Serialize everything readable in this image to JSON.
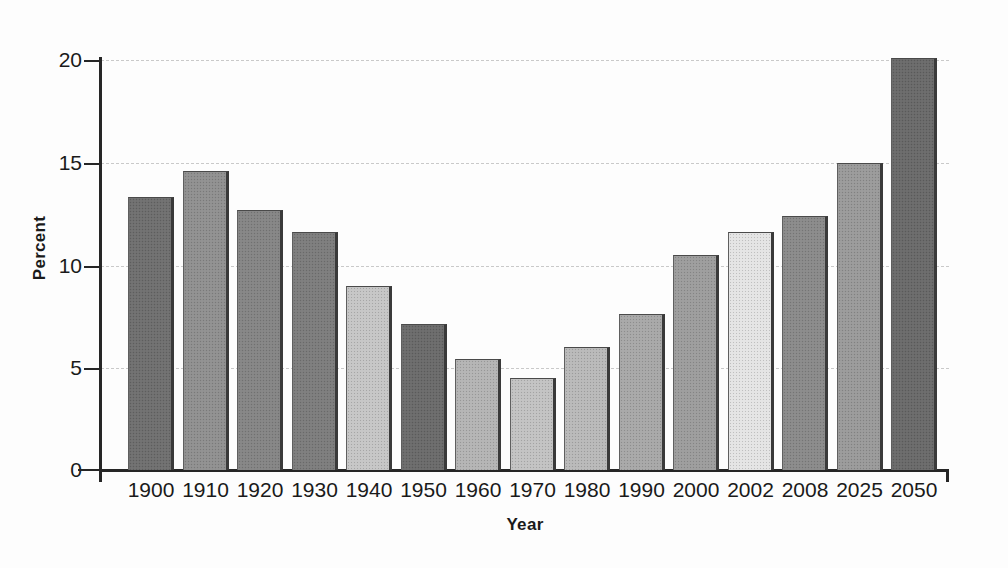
{
  "chart_data": {
    "type": "bar",
    "title": "",
    "xlabel": "Year",
    "ylabel": "Percent",
    "categories": [
      "1900",
      "1910",
      "1920",
      "1930",
      "1940",
      "1950",
      "1960",
      "1970",
      "1980",
      "1990",
      "2000",
      "2002",
      "2008",
      "2025",
      "2050"
    ],
    "values": [
      13.3,
      14.6,
      12.7,
      11.6,
      9.0,
      7.1,
      5.4,
      4.5,
      6.0,
      7.6,
      10.5,
      11.6,
      12.4,
      15.0,
      20.1
    ],
    "ylim": [
      0,
      20
    ],
    "ytick_labels": [
      "0",
      "5",
      "10",
      "15",
      "20"
    ],
    "ytick_values": [
      0,
      5,
      10,
      15,
      20
    ],
    "grid": "horizontal-dashed",
    "legend": "none",
    "bar_colors": [
      "#6f6f6f",
      "#909090",
      "#858585",
      "#7d7d7d",
      "#c6c6c6",
      "#6b6b6b",
      "#b4b4b4",
      "#c2c2c2",
      "#b9b9b9",
      "#a8a8a8",
      "#9d9d9d",
      "#e4e4e4",
      "#8a8a8a",
      "#9a9a9a",
      "#6a6a6a"
    ]
  },
  "axes": {
    "y_title": "Percent",
    "x_title": "Year",
    "axis_color": "#262626",
    "grid_color": "#c9c9c9"
  }
}
